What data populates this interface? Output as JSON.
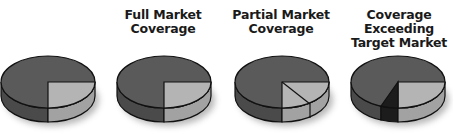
{
  "diagram": {
    "type": "market-coverage-pies",
    "colors": {
      "target_market": "#5a5a5a",
      "target_market_side": "#4a4a4a",
      "coverage": "#b4b4b4",
      "coverage_side": "#a2a2a2",
      "excess": "#1c1c1c",
      "outline": "#111111",
      "shadow": "#9a9a9a"
    },
    "panels": [
      {
        "id": "target-market",
        "title_lines": [],
        "slices": [
          "target"
        ]
      },
      {
        "id": "full-market-coverage",
        "title_lines": [
          "Full Market",
          "Coverage"
        ],
        "slices": [
          "target",
          "coverage-quarter"
        ]
      },
      {
        "id": "partial-market-coverage",
        "title_lines": [
          "Partial Market",
          "Coverage"
        ],
        "slices": [
          "target",
          "coverage-partial-split"
        ]
      },
      {
        "id": "coverage-exceeding-target-market",
        "title_lines": [
          "Coverage",
          "Exceeding",
          "Target Market"
        ],
        "slices": [
          "target",
          "coverage-quarter",
          "excess"
        ]
      }
    ]
  }
}
